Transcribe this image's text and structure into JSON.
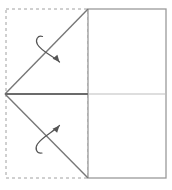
{
  "canvas": {
    "width": 172,
    "height": 190,
    "background": "#ffffff"
  },
  "colors": {
    "solid_line": "#808080",
    "dark_line": "#666666",
    "light_line": "#b9b9b9",
    "dashed_line": "#a0a0a0",
    "arrow_line": "#555555",
    "background": "#ffffff"
  },
  "diagram": {
    "type": "origami-fold-step",
    "vertex": {
      "x": 5,
      "y": 94,
      "label": "left-apex"
    },
    "shapes": {
      "dashed_region": {
        "name": "hidden-left-half",
        "x": 6,
        "y": 9,
        "width": 82,
        "height": 169,
        "stroke": "#a0a0a0",
        "dash": "3 3",
        "fill": "none"
      },
      "solid_rect": {
        "name": "visible-right-half",
        "x": 88,
        "y": 9,
        "width": 78,
        "height": 169,
        "stroke": "#9a9a9a",
        "fill": "#ffffff"
      }
    },
    "creases": [
      {
        "name": "upper-diagonal",
        "x1": 5,
        "y1": 94,
        "x2": 88,
        "y2": 9,
        "style": "solid",
        "stroke": "#777777",
        "width": 1.4
      },
      {
        "name": "lower-diagonal",
        "x1": 5,
        "y1": 94,
        "x2": 88,
        "y2": 178,
        "style": "solid",
        "stroke": "#777777",
        "width": 1.4
      },
      {
        "name": "center-horizontal-left",
        "x1": 5,
        "y1": 94,
        "x2": 88,
        "y2": 94,
        "style": "solid",
        "stroke": "#6b6b6b",
        "width": 2.0
      },
      {
        "name": "center-horizontal-right",
        "x1": 88,
        "y1": 94,
        "x2": 166,
        "y2": 94,
        "style": "solid",
        "stroke": "#bdbdbd",
        "width": 1.2
      }
    ],
    "arrows": [
      {
        "name": "upper-fold-arrow",
        "direction": "down-right",
        "curl_at": "start",
        "path": "M 42.5 36.5 C 37.5 35.0 35.0 40.0 37.5 44.5 C 41.5 51.5 54.0 56.5 59.5 62.0",
        "head": {
          "x": 59.5,
          "y": 62.0,
          "angle": 50
        },
        "stroke": "#555555",
        "width": 1.2
      },
      {
        "name": "lower-fold-arrow",
        "direction": "up-right",
        "curl_at": "start",
        "path": "M 42.0 153.0 C 36.5 154.0 34.5 148.5 37.5 144.0 C 42.0 137.0 54.5 131.0 59.5 125.5",
        "head": {
          "x": 59.5,
          "y": 125.5,
          "angle": -48
        },
        "stroke": "#555555",
        "width": 1.2
      }
    ]
  }
}
